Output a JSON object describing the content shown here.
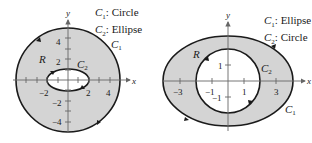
{
  "figures": [
    {
      "id": "left",
      "legend": [
        {
          "curve": "C",
          "sub": "1",
          "text": ": Circle"
        },
        {
          "curve": "C",
          "sub": "2",
          "text": ": Ellipse"
        }
      ],
      "axis_labels": {
        "x": "x",
        "y": "y"
      },
      "x_ticks": [
        "−2",
        "2",
        "4"
      ],
      "y_ticks": [
        "4",
        "2",
        "−2",
        "−4"
      ],
      "region_label": "R",
      "curve_labels": [
        {
          "name": "C",
          "sub": "1"
        },
        {
          "name": "C",
          "sub": "2"
        }
      ],
      "outer": {
        "shape": "circle",
        "radius": 5
      },
      "inner": {
        "shape": "ellipse",
        "rx": 2,
        "ry": 1
      }
    },
    {
      "id": "right",
      "legend": [
        {
          "curve": "C",
          "sub": "1",
          "text": ": Ellipse"
        },
        {
          "curve": "C",
          "sub": "2",
          "text": ": Circle"
        }
      ],
      "axis_labels": {
        "x": "x",
        "y": "y"
      },
      "x_ticks": [
        "−3",
        "−1",
        "1",
        "3"
      ],
      "y_ticks": [
        "1",
        "−1"
      ],
      "region_label": "R",
      "curve_labels": [
        {
          "name": "C",
          "sub": "1"
        },
        {
          "name": "C",
          "sub": "2"
        }
      ],
      "outer": {
        "shape": "ellipse",
        "rx": 4,
        "ry": 3
      },
      "inner": {
        "shape": "circle",
        "radius": 2
      }
    }
  ],
  "colors": {
    "region_fill": "#d4d4d4",
    "stroke": "#1a1a1a",
    "axis": "#555555"
  }
}
